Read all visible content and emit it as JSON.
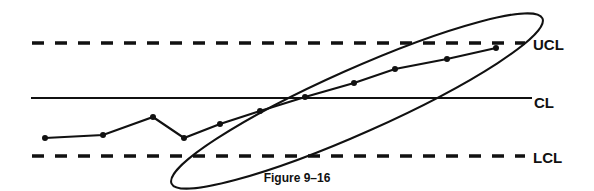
{
  "caption": "Figure 9–16",
  "chart_data": {
    "type": "line",
    "title": "Figure 9–16",
    "xlabel": "",
    "ylabel": "",
    "grid": false,
    "control_limits": {
      "UCL": {
        "label": "UCL",
        "y_px": 43,
        "style": "dashed"
      },
      "CL": {
        "label": "CL",
        "y_px": 98,
        "style": "solid"
      },
      "LCL": {
        "label": "LCL",
        "y_px": 156,
        "style": "dashed"
      }
    },
    "series": [
      {
        "name": "process",
        "points_px": [
          [
            45,
            138
          ],
          [
            103,
            135
          ],
          [
            153,
            117
          ],
          [
            184,
            138
          ],
          [
            220,
            124
          ],
          [
            260,
            111
          ],
          [
            305,
            97
          ],
          [
            354,
            83
          ],
          [
            395,
            69
          ],
          [
            447,
            59
          ],
          [
            496,
            48
          ]
        ]
      }
    ],
    "annotations": [
      {
        "type": "ellipse",
        "description": "upward trend of points circled",
        "cx": 355,
        "cy": 100,
        "rx": 200,
        "ry": 40,
        "rotate": -25
      }
    ]
  },
  "labels": {
    "ucl": "UCL",
    "cl": "CL",
    "lcl": "LCL"
  }
}
